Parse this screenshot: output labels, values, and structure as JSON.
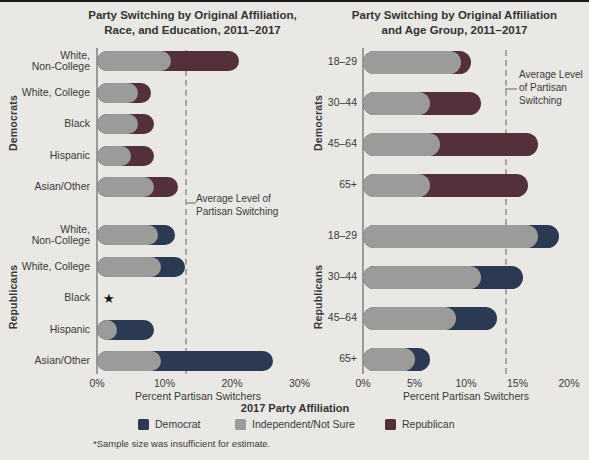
{
  "page": {
    "background": "#e9e8e5",
    "top_rule_color": "#1a1a1a"
  },
  "colors": {
    "democrat": "#2b3a52",
    "independent": "#9b9b99",
    "republican": "#53303a",
    "axis": "#9a9a9a",
    "average_line": "#a8a49e",
    "text": "#3a3a3a"
  },
  "legend": {
    "title": "2017 Party Affiliation",
    "items": [
      {
        "label": "Democrat",
        "color_key": "democrat"
      },
      {
        "label": "Independent/Not Sure",
        "color_key": "independent"
      },
      {
        "label": "Republican",
        "color_key": "republican"
      }
    ]
  },
  "footnote": "*Sample size was insufficient for estimate.",
  "chart_data": [
    {
      "type": "bar",
      "orientation": "horizontal",
      "stacked": true,
      "title_lines": [
        "Party Switching by Original Affiliation,",
        "Race, and Education, 2011–2017"
      ],
      "xlabel": "Percent Partisan Switchers",
      "xlim": [
        0,
        30
      ],
      "x_ticks": [
        {
          "value": 0,
          "label": "0%"
        },
        {
          "value": 10,
          "label": "10%"
        },
        {
          "value": 20,
          "label": "20%"
        },
        {
          "value": 30,
          "label": "30%"
        }
      ],
      "average_line": {
        "value": 13,
        "label_lines": [
          "Average Level of",
          "Partisan Switching"
        ]
      },
      "groups": [
        {
          "label": "Democrats",
          "rows": [
            {
              "label_lines": [
                "White,",
                "Non-College"
              ],
              "independent": 11,
              "republican": 10,
              "democrat": 0
            },
            {
              "label_lines": [
                "White, College"
              ],
              "independent": 6,
              "republican": 2,
              "democrat": 0
            },
            {
              "label_lines": [
                "Black"
              ],
              "independent": 6,
              "republican": 2.5,
              "democrat": 0
            },
            {
              "label_lines": [
                "Hispanic"
              ],
              "independent": 5,
              "republican": 3.5,
              "democrat": 0
            },
            {
              "label_lines": [
                "Asian/Other"
              ],
              "independent": 8.5,
              "republican": 3.5,
              "democrat": 0
            }
          ]
        },
        {
          "label": "Republicans",
          "rows": [
            {
              "label_lines": [
                "White,",
                "Non-College"
              ],
              "independent": 9,
              "democrat": 2.5,
              "republican": 0
            },
            {
              "label_lines": [
                "White, College"
              ],
              "independent": 9.5,
              "democrat": 3.5,
              "republican": 0
            },
            {
              "label_lines": [
                "Black"
              ],
              "insufficient": true,
              "marker": "★"
            },
            {
              "label_lines": [
                "Hispanic"
              ],
              "independent": 3,
              "democrat": 5.5,
              "republican": 0
            },
            {
              "label_lines": [
                "Asian/Other"
              ],
              "independent": 9.5,
              "democrat": 16.5,
              "republican": 0
            }
          ]
        }
      ]
    },
    {
      "type": "bar",
      "orientation": "horizontal",
      "stacked": true,
      "title_lines": [
        "Party Switching by Original Affiliation",
        "and Age Group, 2011–2017"
      ],
      "xlabel": "Percent Partisan Switchers",
      "xlim": [
        0,
        20
      ],
      "x_ticks": [
        {
          "value": 0,
          "label": "0%"
        },
        {
          "value": 5,
          "label": "5%"
        },
        {
          "value": 10,
          "label": "10%"
        },
        {
          "value": 15,
          "label": "15%"
        },
        {
          "value": 20,
          "label": "20%"
        }
      ],
      "average_line": {
        "value": 13.8,
        "label_lines": [
          "Average Level",
          "of Partisan",
          "Switching"
        ]
      },
      "groups": [
        {
          "label": "Democrats",
          "rows": [
            {
              "label_lines": [
                "18–29"
              ],
              "independent": 9.5,
              "republican": 1,
              "democrat": 0
            },
            {
              "label_lines": [
                "30–44"
              ],
              "independent": 6.5,
              "republican": 5,
              "democrat": 0
            },
            {
              "label_lines": [
                "45–64"
              ],
              "independent": 7.5,
              "republican": 9.5,
              "democrat": 0
            },
            {
              "label_lines": [
                "65+"
              ],
              "independent": 6.5,
              "republican": 9.5,
              "democrat": 0
            }
          ]
        },
        {
          "label": "Republicans",
          "rows": [
            {
              "label_lines": [
                "18–29"
              ],
              "independent": 17,
              "democrat": 2,
              "republican": 0
            },
            {
              "label_lines": [
                "30–44"
              ],
              "independent": 11.5,
              "democrat": 4,
              "republican": 0
            },
            {
              "label_lines": [
                "45–64"
              ],
              "independent": 9,
              "democrat": 4,
              "republican": 0
            },
            {
              "label_lines": [
                "65+"
              ],
              "independent": 5,
              "democrat": 1.5,
              "republican": 0
            }
          ]
        }
      ]
    }
  ]
}
